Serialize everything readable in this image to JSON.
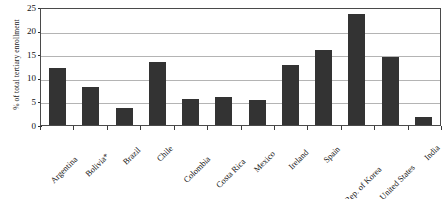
{
  "chart_data": {
    "type": "bar",
    "title": "",
    "subtitle": "",
    "xlabel": "",
    "ylabel": "% of total tertiary enrollment",
    "ylim": [
      0,
      25
    ],
    "yticks": [
      0,
      5,
      10,
      15,
      20,
      25
    ],
    "grid": true,
    "legend": "none",
    "orientation": "vertical",
    "bar_color": "#333333",
    "categories": [
      "Argentina",
      "Bolivia*",
      "Brazil",
      "Chile",
      "Colombia",
      "Costa Rica",
      "Mexico",
      "Ireland",
      "Spain",
      "Rep. of Korea",
      "United States",
      "India"
    ],
    "values": [
      12.0,
      8.0,
      3.5,
      13.3,
      5.5,
      6.0,
      5.2,
      12.7,
      15.8,
      23.5,
      14.5,
      1.7
    ],
    "annotations": [
      "* Bolivia marked with asterisk footnote"
    ]
  },
  "axes": {
    "y_tick_labels": [
      "0",
      "5",
      "10",
      "15",
      "20",
      "25"
    ],
    "y_axis_title": "% of total tertiary enrollment"
  },
  "colors": {
    "bar": "#333333",
    "gridline": "#b4b4b4",
    "axis": "#4a4a4a",
    "background": "#ffffff",
    "text": "#141414"
  }
}
